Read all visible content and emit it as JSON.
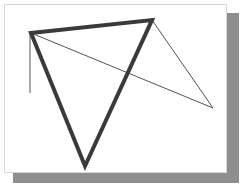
{
  "document": {
    "title": "Geometric line drawing",
    "page": {
      "background_color": "#ffffff",
      "border_color": "#d8d8d8",
      "shadow_color": "#8e8e8e",
      "x": 4,
      "y": 4,
      "width": 223,
      "height": 169
    },
    "canvas": {
      "width": 243,
      "height": 189,
      "background_color": "#ffffff"
    }
  },
  "drawing": {
    "stroke_color_thick": "#3a3a3a",
    "stroke_color_thin": "#545454",
    "thick_width": 4,
    "thin_width": 1,
    "vertices": {
      "top_left": {
        "x": 31,
        "y": 33,
        "label": "A"
      },
      "apex": {
        "x": 152,
        "y": 20,
        "label": "B"
      },
      "bottom": {
        "x": 85,
        "y": 166,
        "label": "C"
      },
      "right": {
        "x": 213,
        "y": 108,
        "label": "D"
      },
      "stub_end": {
        "x": 30,
        "y": 93,
        "label": "E"
      }
    },
    "shapes": [
      {
        "name": "thick-triangle",
        "style": "thick",
        "closed": true,
        "points": "31,33 152,20 85,166"
      },
      {
        "name": "thin-triangle",
        "style": "thin",
        "closed": true,
        "points": "31,33 152,20 213,108"
      },
      {
        "name": "thin-vertical-stub",
        "style": "thin",
        "closed": false,
        "points": "30,33 30,93"
      }
    ]
  }
}
